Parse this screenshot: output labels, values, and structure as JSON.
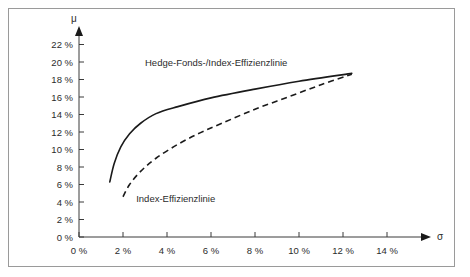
{
  "chart_data": {
    "type": "line",
    "title": "",
    "xlabel": "σ",
    "ylabel": "μ",
    "xlim": [
      0,
      15.2
    ],
    "ylim": [
      0,
      23.4
    ],
    "grid": false,
    "legend_position": "inline-annotations",
    "x_tick_labels": [
      "0 %",
      "2 %",
      "4 %",
      "6 %",
      "8 %",
      "10 %",
      "12 %",
      "14 %"
    ],
    "x_tick_values": [
      0,
      2,
      4,
      6,
      8,
      10,
      12,
      14
    ],
    "y_tick_labels": [
      "0 %",
      "2 %",
      "4 %",
      "6 %",
      "8 %",
      "10 %",
      "12 %",
      "14 %",
      "16 %",
      "18 %",
      "20 %",
      "22 %"
    ],
    "y_tick_values": [
      0,
      2,
      4,
      6,
      8,
      10,
      12,
      14,
      16,
      18,
      20,
      22
    ],
    "series": [
      {
        "name": "Hedge-Fonds-/Index-Effizienzlinie",
        "style": "solid",
        "color": "#1a1a1a",
        "points": [
          [
            1.4,
            6.3
          ],
          [
            1.6,
            8.4
          ],
          [
            1.9,
            10.3
          ],
          [
            2.3,
            11.8
          ],
          [
            2.8,
            13.0
          ],
          [
            3.5,
            14.1
          ],
          [
            4.5,
            14.9
          ],
          [
            6.0,
            15.9
          ],
          [
            8.0,
            16.9
          ],
          [
            10.0,
            17.8
          ],
          [
            12.4,
            18.7
          ]
        ]
      },
      {
        "name": "Index-Effizienzlinie",
        "style": "dashed",
        "color": "#1a1a1a",
        "points": [
          [
            2.0,
            4.6
          ],
          [
            2.3,
            6.0
          ],
          [
            2.8,
            7.5
          ],
          [
            3.5,
            9.0
          ],
          [
            4.5,
            10.6
          ],
          [
            5.5,
            11.9
          ],
          [
            6.5,
            13.0
          ],
          [
            8.0,
            14.6
          ],
          [
            9.5,
            16.0
          ],
          [
            11.0,
            17.4
          ],
          [
            12.4,
            18.6
          ]
        ]
      }
    ],
    "annotations": [
      {
        "text": "Hedge-Fonds-/Index-Effizienzlinie",
        "x": 3.0,
        "y": 19.6
      },
      {
        "text": "Index-Effizienzlinie",
        "x": 2.6,
        "y": 4.0
      }
    ]
  }
}
